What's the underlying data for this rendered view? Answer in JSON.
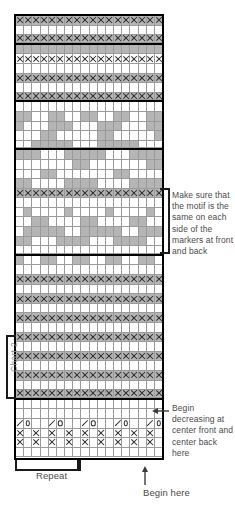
{
  "chart_data": {
    "type": "heatmap",
    "xlabel": "stitches",
    "ylabel": "rows",
    "columns": 18,
    "rows": 46,
    "grid": true,
    "legend_position": "none",
    "colors": {
      "main_color": "#b5b5b5",
      "contrast_color": "#ffffff",
      "symbol_color": "#2a2a2a",
      "border_color": "#000000",
      "grid_line": "#9a9a9a",
      "text_color": "#4a4a4a",
      "chart_label_color": "#8d8d8d"
    },
    "symbols": [
      {
        "name": "x-symbol",
        "glyph": "X",
        "meaning": "purl / contrast stitch"
      },
      {
        "name": "slash-symbol",
        "glyph": "/",
        "meaning": "decrease (k2tog)"
      },
      {
        "name": "circle-symbol",
        "glyph": "O",
        "meaning": "yarn over"
      }
    ],
    "row_legend": "g = grey (main color) cell, w = white (contrast) cell, x = X symbol, sl = slash, o = circle",
    "rows_top_to_bottom": [
      {
        "i": 1,
        "bg": "gggggggggggggggggg",
        "sym": "xxxxxxxxxxxxxxxxxx",
        "rule": "none"
      },
      {
        "i": 2,
        "bg": "wwwwwwwwwwwwwwwwww",
        "sym": "..................",
        "rule": "none"
      },
      {
        "i": 3,
        "bg": "gggggggggggggggggg",
        "sym": "xxxxxxxxxxxxxxxxxx",
        "rule": "bottom"
      },
      {
        "i": 4,
        "bg": "gggggggggggggggggg",
        "sym": "..................",
        "rule": "none"
      },
      {
        "i": 5,
        "bg": "wwwwwwwwwwwwwwwwww",
        "sym": "xxxxxxxxxxxxxxxxxx",
        "rule": "none"
      },
      {
        "i": 6,
        "bg": "wwwwwwwwwwwwwwwwww",
        "sym": "..................",
        "rule": "none"
      },
      {
        "i": 7,
        "bg": "gggggggggggggggggg",
        "sym": "xxxxxxxxxxxxxxxxxx",
        "rule": "none"
      },
      {
        "i": 8,
        "bg": "wwwwwwwwwwwwwwwwww",
        "sym": "..................",
        "rule": "none"
      },
      {
        "i": 9,
        "bg": "gggggggggggggggggg",
        "sym": "xxxxxxxxxxxxxxxxxx",
        "rule": "bottom"
      },
      {
        "i": 10,
        "bg": "wwwwwwwwwwwwwwwwww",
        "sym": "..................",
        "rule": "none"
      },
      {
        "i": 11,
        "bg": "ggwwggwwggwwggwwgg",
        "sym": "..................",
        "rule": "none"
      },
      {
        "i": 12,
        "bg": "gwwwgggwwwgggwwwgg",
        "sym": "..................",
        "rule": "none"
      },
      {
        "i": 13,
        "bg": "wwwggwwwwwggwwwwwg",
        "sym": "..................",
        "rule": "none"
      },
      {
        "i": 14,
        "bg": "wwgggggwwwgggggwww",
        "sym": "..................",
        "rule": "bottom"
      },
      {
        "i": 15,
        "bg": "gggwwwgggggwwwgggg",
        "sym": "..................",
        "rule": "none"
      },
      {
        "i": 16,
        "bg": "wwwwwwwggwwwwwwwgg",
        "sym": "..................",
        "rule": "none"
      },
      {
        "i": 17,
        "bg": "wwwggwwwwwwwggwwww",
        "sym": "..................",
        "rule": "none"
      },
      {
        "i": 18,
        "bg": "ggwwwwggggwwwwgggg",
        "sym": "..................",
        "rule": "none"
      },
      {
        "i": 19,
        "bg": "gggggggggggggggggg",
        "sym": "xxxxxxxxxxxxxxxxxx",
        "rule": "none"
      },
      {
        "i": 20,
        "bg": "wwwwwwwwwwwwwwwwww",
        "sym": "..................",
        "rule": "none"
      },
      {
        "i": 21,
        "bg": "wgwwwwgwwwwgwwwwgw",
        "sym": "..................",
        "rule": "none"
      },
      {
        "i": 22,
        "bg": "wwggwwwwggwwwwggww",
        "sym": "..................",
        "rule": "none"
      },
      {
        "i": 23,
        "bg": "wgggggwwgggggwwggg",
        "sym": "..................",
        "rule": "none"
      },
      {
        "i": 24,
        "bg": "ggwwwggggwwwggggww",
        "sym": "..................",
        "rule": "none"
      },
      {
        "i": 25,
        "bg": "wwwwwwwwwwwwwwwwww",
        "sym": "..................",
        "rule": "bottom"
      },
      {
        "i": 26,
        "bg": "gwwggwwggwwggwwggw",
        "sym": "..................",
        "rule": "none"
      },
      {
        "i": 27,
        "bg": "wwwwwwwwwwwwwwwwww",
        "sym": "..................",
        "rule": "none"
      },
      {
        "i": 28,
        "bg": "gggggggggggggggggg",
        "sym": "xxxxxxxxxxxxxxxxxx",
        "rule": "none"
      },
      {
        "i": 29,
        "bg": "wwwwwwwwwwwwwwwwww",
        "sym": "..................",
        "rule": "none"
      },
      {
        "i": 30,
        "bg": "gggggggggggggggggg",
        "sym": "xxxxxxxxxxxxxxxxxx",
        "rule": "none"
      },
      {
        "i": 31,
        "bg": "wwwwwwwwwwwwwwwwww",
        "sym": "..................",
        "rule": "none"
      },
      {
        "i": 32,
        "bg": "gggggggggggggggggg",
        "sym": "xxxxxxxxxxxxxxxxxx",
        "rule": "none"
      },
      {
        "i": 33,
        "bg": "wwwwwwwwwwwwwwwwww",
        "sym": "..................",
        "rule": "none"
      },
      {
        "i": 34,
        "bg": "gggggggggggggggggg",
        "sym": "xxxxxxxxxxxxxxxxxx",
        "rule": "none"
      },
      {
        "i": 35,
        "bg": "wwwwwwwwwwwwwwwwww",
        "sym": "..................",
        "rule": "none"
      },
      {
        "i": 36,
        "bg": "gggggggggggggggggg",
        "sym": "xxxxxxxxxxxxxxxxxx",
        "rule": "none"
      },
      {
        "i": 37,
        "bg": "wwwwwwwwwwwwwwwwww",
        "sym": "..................",
        "rule": "none"
      },
      {
        "i": 38,
        "bg": "gggggggggggggggggg",
        "sym": "xxxxxxxxxxxxxxxxxx",
        "rule": "none"
      },
      {
        "i": 39,
        "bg": "wwwwwwwwwwwwwwwwww",
        "sym": "..................",
        "rule": "none"
      },
      {
        "i": 40,
        "bg": "gggggggggggggggggg",
        "sym": "xxxxxxxxxxxxxxxxxx",
        "rule": "bottom"
      },
      {
        "i": 41,
        "bg": "wwwwwwwwwwwwwwwwww",
        "sym": "..................",
        "rule": "none"
      },
      {
        "i": 42,
        "bg": "wwwwwwwwwwwwwwwwww",
        "sym": "..................",
        "rule": "none"
      },
      {
        "i": 43,
        "bg": "wwwwwwwwwwwwwwwwww",
        "sym": "so..so..so..so..so",
        "rule": "none"
      },
      {
        "i": 44,
        "bg": "wwwwwwwwwwwwwwwwww",
        "sym": "x.x.x.x.x.x.x.x.x.",
        "rule": "none"
      },
      {
        "i": 45,
        "bg": "wwwwwwwwwwwwwwwwww",
        "sym": "x.x.x.x.x.x.x.x.x.",
        "rule": "none"
      },
      {
        "i": 46,
        "bg": "wwwwwwwwwwwwwwwwww",
        "sym": "..................",
        "rule": "none"
      }
    ]
  },
  "annotations": {
    "motif_note": "Make sure that the motif is the same on each side of the markers at front and back",
    "decrease_note": "Begin decreasing at center front and center back here",
    "repeat_label": "Repeat",
    "begin_here_label": "Begin here",
    "chart_label": "Chart 2"
  },
  "icons": {
    "left_arrow": "left-arrow-icon",
    "up_arrow": "up-arrow-icon",
    "motif_bracket": "bracket-icon",
    "chart2_bracket": "bracket-icon",
    "repeat_bracket": "bracket-icon"
  }
}
